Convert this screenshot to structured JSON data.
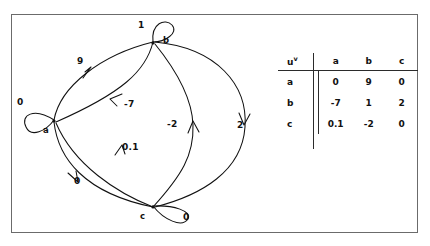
{
  "figure": {
    "type": "directed-weighted-graph-with-adjacency-matrix",
    "nodes": [
      {
        "id": "a",
        "label": "a",
        "x": 53,
        "y": 119
      },
      {
        "id": "b",
        "label": "b",
        "x": 152,
        "y": 41
      },
      {
        "id": "c",
        "label": "c",
        "x": 152,
        "y": 205
      }
    ],
    "edges": [
      {
        "from": "a",
        "to": "a",
        "weight": "0",
        "label_x": 18,
        "label_y": 100,
        "kind": "self-loop"
      },
      {
        "from": "b",
        "to": "b",
        "weight": "1",
        "label_x": 138,
        "label_y": 22,
        "kind": "self-loop"
      },
      {
        "from": "c",
        "to": "c",
        "weight": "0",
        "label_x": 183,
        "label_y": 214,
        "kind": "self-loop"
      },
      {
        "from": "a",
        "to": "b",
        "weight": "9",
        "label_x": 77,
        "label_y": 55,
        "kind": "arc"
      },
      {
        "from": "b",
        "to": "a",
        "weight": "-7",
        "label_x": 126,
        "label_y": 99,
        "kind": "arc"
      },
      {
        "from": "b",
        "to": "c",
        "weight": "2",
        "label_x": 237,
        "label_y": 119,
        "kind": "arc"
      },
      {
        "from": "c",
        "to": "b",
        "weight": "-2",
        "label_x": 173,
        "label_y": 119,
        "kind": "arc"
      },
      {
        "from": "a",
        "to": "c",
        "weight": "0",
        "label_x": 74,
        "label_y": 178,
        "kind": "arc"
      },
      {
        "from": "c",
        "to": "a",
        "weight": "0.1",
        "label_x": 122,
        "label_y": 144,
        "kind": "arc"
      }
    ]
  },
  "matrix": {
    "corner_label": "u",
    "corner_superscript": "v",
    "columns": [
      "a",
      "b",
      "c"
    ],
    "rows": [
      {
        "head": "a",
        "values": [
          "0",
          "9",
          "0"
        ]
      },
      {
        "head": "b",
        "values": [
          "-7",
          "1",
          "2"
        ]
      },
      {
        "head": "c",
        "values": [
          "0.1",
          "-2",
          "0"
        ]
      }
    ]
  },
  "colors": {
    "ink": "#111111",
    "frame": "#6b6b6b",
    "rule": "#2b2b2b",
    "background": "#ffffff"
  }
}
